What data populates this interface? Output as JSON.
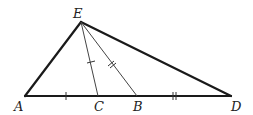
{
  "diagram": {
    "type": "geometry",
    "colors": {
      "stroke": "#1a1a1a",
      "thin_stroke": "#444444",
      "label": "#222222",
      "background": "#ffffff"
    },
    "points": {
      "A": {
        "label": "A",
        "x": 25,
        "y": 96
      },
      "C": {
        "label": "C",
        "x": 98,
        "y": 96
      },
      "B": {
        "label": "B",
        "x": 137,
        "y": 96
      },
      "D": {
        "label": "D",
        "x": 231,
        "y": 96
      },
      "E": {
        "label": "E",
        "x": 81,
        "y": 22
      }
    },
    "segments": [
      {
        "from": "A",
        "to": "E",
        "weight": "thick"
      },
      {
        "from": "E",
        "to": "D",
        "weight": "thick"
      },
      {
        "from": "A",
        "to": "D",
        "weight": "thick"
      },
      {
        "from": "E",
        "to": "C",
        "weight": "thin"
      },
      {
        "from": "E",
        "to": "B",
        "weight": "thin"
      }
    ],
    "equal_marks": [
      {
        "segment": "AC",
        "ticks": 1
      },
      {
        "segment": "EC",
        "ticks": 1
      },
      {
        "segment": "EB",
        "ticks": 2
      },
      {
        "segment": "BD",
        "ticks": 2
      }
    ]
  }
}
